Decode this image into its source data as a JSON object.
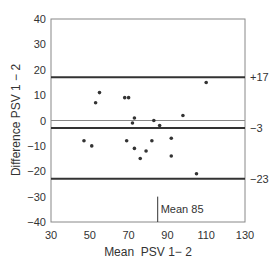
{
  "chart_data": {
    "type": "scatter",
    "title": "",
    "xlabel": "Mean  PSV 1− 2",
    "ylabel": "Difference PSV 1 − 2",
    "xlim": [
      30,
      130
    ],
    "ylim": [
      -40,
      40
    ],
    "x_ticks": [
      30,
      50,
      70,
      90,
      110,
      130
    ],
    "x_tick_labels": [
      "30",
      "50",
      "70",
      "90",
      "110",
      "130"
    ],
    "y_ticks": [
      40,
      30,
      20,
      10,
      0,
      -10,
      -20,
      -30,
      -40
    ],
    "y_tick_labels": [
      "40",
      "30",
      "20",
      "10",
      "0",
      "−10",
      "−20",
      "−30",
      "−40"
    ],
    "grid": false,
    "legend": null,
    "points": [
      {
        "x": 55,
        "y": 11
      },
      {
        "x": 53,
        "y": 7
      },
      {
        "x": 68,
        "y": 9
      },
      {
        "x": 70,
        "y": 9
      },
      {
        "x": 73,
        "y": 1
      },
      {
        "x": 72,
        "y": -1
      },
      {
        "x": 47,
        "y": -8
      },
      {
        "x": 51,
        "y": -10
      },
      {
        "x": 69,
        "y": -8
      },
      {
        "x": 73,
        "y": -11
      },
      {
        "x": 79,
        "y": -12
      },
      {
        "x": 76,
        "y": -15
      },
      {
        "x": 110,
        "y": 15
      },
      {
        "x": 98,
        "y": 2
      },
      {
        "x": 83,
        "y": 0
      },
      {
        "x": 86,
        "y": -2
      },
      {
        "x": 82,
        "y": -8
      },
      {
        "x": 92,
        "y": -7
      },
      {
        "x": 92,
        "y": -14
      },
      {
        "x": 105,
        "y": -21
      }
    ],
    "reference_lines": [
      {
        "name": "zero",
        "y": 0,
        "style": "thin"
      },
      {
        "name": "upper-limit",
        "y": 17,
        "label": "+17",
        "style": "thick"
      },
      {
        "name": "mean-difference",
        "y": -3,
        "label": "−3",
        "style": "thick"
      },
      {
        "name": "lower-limit",
        "y": -23,
        "label": "−23",
        "style": "thick"
      }
    ],
    "annotations": [
      {
        "text": "Mean 85",
        "x": 85,
        "y_from": -40,
        "y_to": -30
      }
    ]
  }
}
